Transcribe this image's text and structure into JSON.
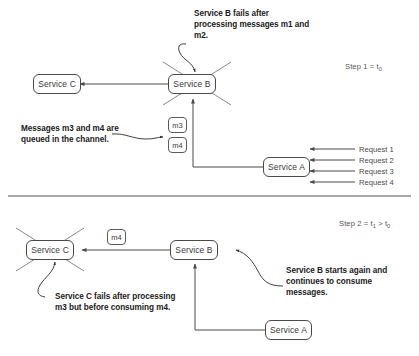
{
  "diagram": {
    "title_hidden": "",
    "colors": {
      "stroke": "#4a4a4a",
      "text": "#3a3a3a",
      "annotation": "#1a1a1a",
      "divider": "#555555",
      "background": "#ffffff"
    }
  },
  "panel_top": {
    "step_label_prefix": "Step 1 = t",
    "step_label_sub": "0",
    "nodes": {
      "service_c": "Service C",
      "service_b": "Service B",
      "service_a": "Service A"
    },
    "messages": [
      "m3",
      "m4"
    ],
    "annotations": {
      "service_b_fail": "Service B fails after processing messages m1 and m2.",
      "messages_queued": "Messages m3 and m4 are queued in the channel."
    },
    "requests": [
      "Request 1",
      "Request 2",
      "Request 3",
      "Request 4"
    ]
  },
  "panel_bottom": {
    "step_label_prefix": "Step 2 = t",
    "step_label_sub": "1",
    "step_label_mid": " > t",
    "step_label_sub2": "0",
    "nodes": {
      "service_c": "Service C",
      "service_b": "Service B",
      "service_a": "Service A"
    },
    "messages": [
      "m4"
    ],
    "annotations": {
      "service_c_fail": "Service C fails after processing m3 but before consuming m4.",
      "service_b_restart": "Service B starts again and continues to consume messages."
    }
  }
}
